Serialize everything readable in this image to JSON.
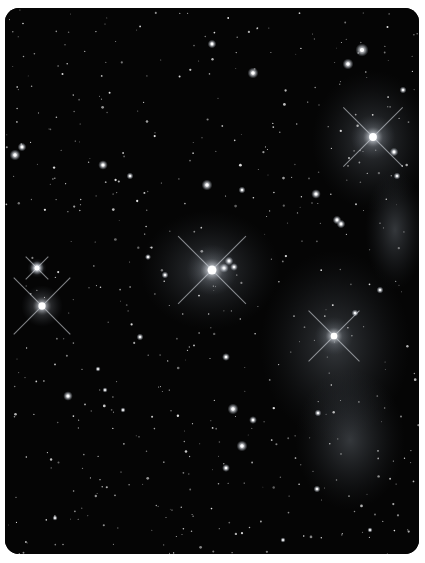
{
  "image": {
    "subject": "star cluster astrophotograph with reflection nebulosity",
    "alt": "Star field with several bright diffraction-spiked stars and faint blue-grey nebula",
    "caption_clipped": "",
    "colors": {
      "page_background": "#ffffff",
      "sky_background": "#050505",
      "star": "#ffffff",
      "nebula": "#8c96a0"
    }
  }
}
